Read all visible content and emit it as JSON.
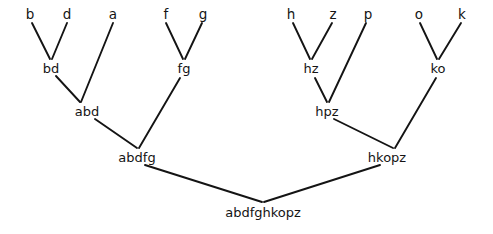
{
  "figure": {
    "type": "dendrogram",
    "title": "",
    "background_color": "#ffffff",
    "line_color": "#141414",
    "text_color": "#141414",
    "width": 493,
    "height": 234
  },
  "chart_data": {
    "type": "tree",
    "title": "",
    "xlabel": "",
    "ylabel": "",
    "leaves": [
      "b",
      "d",
      "a",
      "f",
      "g",
      "h",
      "z",
      "p",
      "o",
      "k"
    ],
    "root": "abdfghkopz",
    "merges": [
      {
        "label": "bd",
        "children": [
          "b",
          "d"
        ]
      },
      {
        "label": "fg",
        "children": [
          "f",
          "g"
        ]
      },
      {
        "label": "hz",
        "children": [
          "h",
          "z"
        ]
      },
      {
        "label": "ko",
        "children": [
          "o",
          "k"
        ]
      },
      {
        "label": "abd",
        "children": [
          "bd",
          "a"
        ]
      },
      {
        "label": "hpz",
        "children": [
          "hz",
          "p"
        ]
      },
      {
        "label": "abdfg",
        "children": [
          "abd",
          "fg"
        ]
      },
      {
        "label": "hkopz",
        "children": [
          "hpz",
          "ko"
        ]
      },
      {
        "label": "abdfghkopz",
        "children": [
          "abdfg",
          "hkopz"
        ]
      }
    ]
  },
  "nodes": [
    {
      "id": "b",
      "label": "b",
      "x": 30,
      "y": 14,
      "kind": "leaf"
    },
    {
      "id": "d",
      "label": "d",
      "x": 67,
      "y": 14,
      "kind": "leaf"
    },
    {
      "id": "a",
      "label": "a",
      "x": 113,
      "y": 14,
      "kind": "leaf"
    },
    {
      "id": "f",
      "label": "f",
      "x": 166,
      "y": 14,
      "kind": "leaf"
    },
    {
      "id": "g",
      "label": "g",
      "x": 203,
      "y": 14,
      "kind": "leaf"
    },
    {
      "id": "h",
      "label": "h",
      "x": 291,
      "y": 14,
      "kind": "leaf"
    },
    {
      "id": "z",
      "label": "z",
      "x": 333,
      "y": 14,
      "kind": "leaf"
    },
    {
      "id": "p",
      "label": "p",
      "x": 368,
      "y": 14,
      "kind": "leaf"
    },
    {
      "id": "o",
      "label": "o",
      "x": 419,
      "y": 14,
      "kind": "leaf"
    },
    {
      "id": "k",
      "label": "k",
      "x": 462,
      "y": 14,
      "kind": "leaf"
    },
    {
      "id": "bd",
      "label": "bd",
      "x": 51,
      "y": 68,
      "kind": "internal"
    },
    {
      "id": "fg",
      "label": "fg",
      "x": 184,
      "y": 68,
      "kind": "internal"
    },
    {
      "id": "hz",
      "label": "hz",
      "x": 311,
      "y": 68,
      "kind": "internal"
    },
    {
      "id": "ko",
      "label": "ko",
      "x": 438,
      "y": 68,
      "kind": "internal"
    },
    {
      "id": "abd",
      "label": "abd",
      "x": 87,
      "y": 111,
      "kind": "internal"
    },
    {
      "id": "hpz",
      "label": "hpz",
      "x": 327,
      "y": 111,
      "kind": "internal"
    },
    {
      "id": "abdfg",
      "label": "abdfg",
      "x": 137,
      "y": 157,
      "kind": "internal"
    },
    {
      "id": "hkopz",
      "label": "hkopz",
      "x": 387,
      "y": 157,
      "kind": "internal"
    },
    {
      "id": "abdfghkopz",
      "label": "abdfghkopz",
      "x": 263,
      "y": 212,
      "kind": "root"
    }
  ],
  "edges": [
    {
      "from": "b",
      "to": "bd",
      "x1": 32,
      "y1": 23,
      "x2": 50,
      "y2": 59
    },
    {
      "from": "d",
      "to": "bd",
      "x1": 67,
      "y1": 23,
      "x2": 52,
      "y2": 59
    },
    {
      "from": "bd",
      "to": "abd",
      "x1": 56,
      "y1": 76,
      "x2": 80,
      "y2": 102
    },
    {
      "from": "a",
      "to": "abd",
      "x1": 113,
      "y1": 23,
      "x2": 81,
      "y2": 102
    },
    {
      "from": "f",
      "to": "fg",
      "x1": 166,
      "y1": 23,
      "x2": 183,
      "y2": 59
    },
    {
      "from": "g",
      "to": "fg",
      "x1": 202,
      "y1": 23,
      "x2": 185,
      "y2": 59
    },
    {
      "from": "abd",
      "to": "abdfg",
      "x1": 95,
      "y1": 119,
      "x2": 137,
      "y2": 148
    },
    {
      "from": "fg",
      "to": "abdfg",
      "x1": 180,
      "y1": 78,
      "x2": 139,
      "y2": 148
    },
    {
      "from": "h",
      "to": "hz",
      "x1": 293,
      "y1": 23,
      "x2": 310,
      "y2": 59
    },
    {
      "from": "z",
      "to": "hz",
      "x1": 332,
      "y1": 23,
      "x2": 312,
      "y2": 59
    },
    {
      "from": "hz",
      "to": "hpz",
      "x1": 315,
      "y1": 78,
      "x2": 327,
      "y2": 102
    },
    {
      "from": "p",
      "to": "hpz",
      "x1": 366,
      "y1": 23,
      "x2": 329,
      "y2": 102
    },
    {
      "from": "o",
      "to": "ko",
      "x1": 420,
      "y1": 23,
      "x2": 437,
      "y2": 59
    },
    {
      "from": "k",
      "to": "ko",
      "x1": 461,
      "y1": 23,
      "x2": 439,
      "y2": 59
    },
    {
      "from": "hpz",
      "to": "hkopz",
      "x1": 334,
      "y1": 119,
      "x2": 393,
      "y2": 148
    },
    {
      "from": "ko",
      "to": "hkopz",
      "x1": 436,
      "y1": 78,
      "x2": 395,
      "y2": 148
    },
    {
      "from": "abdfg",
      "to": "abdfghkopz",
      "x1": 145,
      "y1": 165,
      "x2": 262,
      "y2": 202
    },
    {
      "from": "hkopz",
      "to": "abdfghkopz",
      "x1": 380,
      "y1": 165,
      "x2": 264,
      "y2": 202
    }
  ]
}
